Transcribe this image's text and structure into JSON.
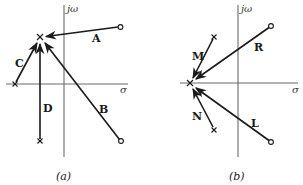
{
  "figure": {
    "type": "root-locus-sketch",
    "panels": [
      {
        "id": "a",
        "caption": "(a)",
        "axis_labels": {
          "imag": "jω",
          "real": "σ"
        },
        "target_pole": {
          "x": 40,
          "y": 37
        },
        "branches": [
          {
            "label": "A",
            "start_marker": "zero",
            "from": [
              120,
              27
            ],
            "to": [
              46,
              37
            ],
            "label_pos": [
              93,
              38
            ]
          },
          {
            "label": "B",
            "start_marker": "zero",
            "from": [
              121,
              141
            ],
            "to": [
              45,
              43
            ],
            "label_pos": [
              100,
              109
            ]
          },
          {
            "label": "C",
            "start_marker": "pole",
            "from": [
              15,
              84
            ],
            "to": [
              37,
              43
            ],
            "label_pos": [
              16,
              63
            ]
          },
          {
            "label": "D",
            "start_marker": "pole",
            "from": [
              40,
              141
            ],
            "to": [
              40,
              44
            ],
            "label_pos": [
              44,
              112
            ]
          }
        ]
      },
      {
        "id": "b",
        "caption": "(b)",
        "axis_labels": {
          "imag": "jω",
          "real": "σ"
        },
        "target_pole": {
          "x": 190,
          "y": 83
        },
        "branches": [
          {
            "label": "M",
            "start_marker": "pole",
            "from": [
              214,
              37
            ],
            "to": [
              193,
              78
            ],
            "label_pos": [
              193,
              60
            ]
          },
          {
            "label": "R",
            "start_marker": "zero",
            "from": [
              271,
              26
            ],
            "to": [
              196,
              79
            ],
            "label_pos": [
              255,
              50
            ]
          },
          {
            "label": "N",
            "start_marker": "pole",
            "from": [
              214,
              130
            ],
            "to": [
              193,
              89
            ],
            "label_pos": [
              193,
              120
            ]
          },
          {
            "label": "L",
            "start_marker": "zero",
            "from": [
              271,
              142
            ],
            "to": [
              196,
              88
            ],
            "label_pos": [
              252,
              127
            ]
          }
        ]
      }
    ]
  },
  "labels": {
    "a_jw": "jω",
    "a_sigma": "σ",
    "a_A": "A",
    "a_B": "B",
    "a_C": "C",
    "a_D": "D",
    "a_caption": "(a)",
    "b_jw": "jω",
    "b_sigma": "σ",
    "b_M": "M",
    "b_R": "R",
    "b_N": "N",
    "b_L": "L",
    "b_caption": "(b)"
  }
}
